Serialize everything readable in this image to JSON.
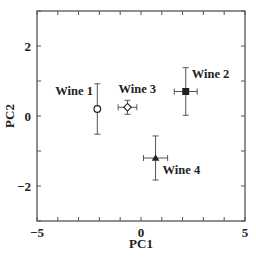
{
  "chart_data": {
    "type": "scatter",
    "title": "",
    "xlabel": "PC1",
    "ylabel": "PC2",
    "xlim": [
      -5,
      5
    ],
    "ylim": [
      -3,
      3
    ],
    "x_ticks": [
      -5,
      -4,
      -3,
      -2,
      -1,
      0,
      1,
      2,
      3,
      4,
      5
    ],
    "x_tick_labels": [
      {
        "value": -5,
        "label": "−5"
      },
      {
        "value": 0,
        "label": "0"
      },
      {
        "value": 5,
        "label": "5"
      }
    ],
    "y_ticks": [
      -3,
      -2,
      -1,
      0,
      1,
      2,
      3
    ],
    "y_tick_labels": [
      {
        "value": 2,
        "label": "2"
      },
      {
        "value": 0,
        "label": "0"
      },
      {
        "value": -2,
        "label": "−2"
      }
    ],
    "grid": false,
    "legend": null,
    "series": [
      {
        "name": "Wine 1",
        "x": -2.1,
        "y": 0.2,
        "xerr": 0.0,
        "yerr": 0.72,
        "marker": "open-circle",
        "label_pos": "left"
      },
      {
        "name": "Wine 2",
        "x": 2.15,
        "y": 0.7,
        "xerr": 0.55,
        "yerr": 0.68,
        "marker": "filled-square",
        "label_pos": "upper-right"
      },
      {
        "name": "Wine 3",
        "x": -0.65,
        "y": 0.25,
        "xerr": 0.45,
        "yerr": 0.2,
        "marker": "open-diamond",
        "label_pos": "above"
      },
      {
        "name": "Wine 4",
        "x": 0.7,
        "y": -1.2,
        "xerr": 0.58,
        "yerr": 0.63,
        "marker": "filled-triangle",
        "label_pos": "lower-right"
      }
    ]
  },
  "colors": {
    "axis": "#555555",
    "marker": "#222222",
    "errorbar": "#555555",
    "background": "#ffffff"
  }
}
